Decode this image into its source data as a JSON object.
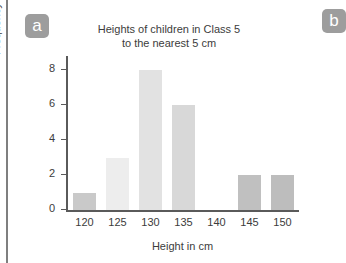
{
  "badges": [
    {
      "label": "a",
      "name": "part-label-a"
    },
    {
      "label": "b",
      "name": "part-label-b"
    }
  ],
  "chart_data": {
    "type": "bar",
    "title": "Heights of children in Class 5 to the nearest 5 cm",
    "title_line1": "Heights of children in Class 5",
    "title_line2": "to the nearest 5 cm",
    "xlabel": "Height in cm",
    "ylabel": "Frequency",
    "categories": [
      "120",
      "125",
      "130",
      "135",
      "140",
      "145",
      "150"
    ],
    "values": [
      1,
      3,
      8,
      6,
      0,
      2,
      2
    ],
    "bar_colors": [
      "#c9c9c9",
      "#ededed",
      "#e2e2e2",
      "#d8d8d8",
      "#ffffff",
      "#c0c0c0",
      "#bdbdbd"
    ],
    "ylim": [
      0,
      8.6
    ],
    "yticks": [
      0,
      2,
      4,
      6,
      8
    ],
    "ytick_labels": [
      "0",
      "2",
      "4",
      "6",
      "8"
    ],
    "grid": false,
    "legend": false
  },
  "colors": {
    "axis": "#5a5a5a",
    "text": "#3c3c3c",
    "badge_bg": "#9d9d9d",
    "badge_text": "#ffffff",
    "frame_rule": "#7f7f7f"
  }
}
